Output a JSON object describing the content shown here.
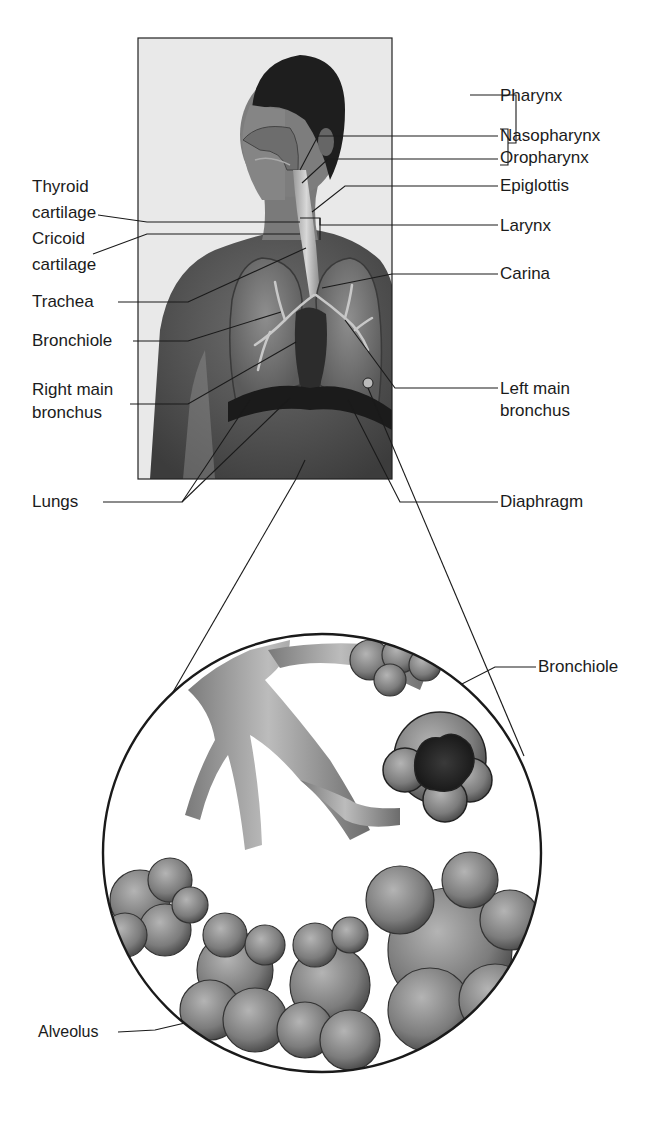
{
  "figure": {
    "colors": {
      "background": "#ffffff",
      "line": "#1a1a1a",
      "photo_bg": "#e8e8e8",
      "skin": "#6a6a6a",
      "hair": "#1e1e1e",
      "lung": "#9a9a9a",
      "alveoli": "#8a8a8a"
    }
  },
  "labels": {
    "left": [
      {
        "id": "thyroid",
        "line1": "Thyroid",
        "line2": "cartilage"
      },
      {
        "id": "cricoid",
        "line1": "Cricoid",
        "line2": "cartilage"
      },
      {
        "id": "trachea",
        "line1": "Trachea"
      },
      {
        "id": "bronchiole_upper",
        "line1": "Bronchiole"
      },
      {
        "id": "right_main_bronchus",
        "line1": "Right main",
        "line2": "bronchus"
      },
      {
        "id": "lungs",
        "line1": "Lungs"
      }
    ],
    "right": [
      {
        "id": "pharynx",
        "line1": "Pharynx"
      },
      {
        "id": "nasopharynx",
        "line1": "Nasopharynx"
      },
      {
        "id": "oropharynx",
        "line1": "Oropharynx"
      },
      {
        "id": "epiglottis",
        "line1": "Epiglottis"
      },
      {
        "id": "larynx",
        "line1": "Larynx"
      },
      {
        "id": "carina",
        "line1": "Carina"
      },
      {
        "id": "left_main_bronchus",
        "line1": "Left main",
        "line2": "bronchus"
      },
      {
        "id": "diaphragm",
        "line1": "Diaphragm"
      }
    ],
    "magnified": [
      {
        "id": "bronchiole_mag",
        "line1": "Bronchiole"
      },
      {
        "id": "alveolus",
        "line1": "Alveolus"
      }
    ]
  }
}
